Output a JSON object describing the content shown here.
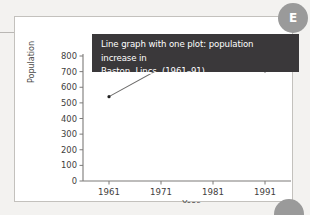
{
  "figure": {
    "badge_label": "E",
    "caption": "Line graph with one plot: population increase in\nBaston, Lincs. (1961–91)"
  },
  "chart_data": {
    "type": "line",
    "title": "Line graph with one plot: population increase in Baston, Lincs. (1961–91)",
    "xlabel": "Year",
    "ylabel": "Population",
    "categories": [
      "1961",
      "1971",
      "1981",
      "1991"
    ],
    "x": [
      1961,
      1971,
      1981,
      1991
    ],
    "values": [
      540,
      723,
      725,
      705
    ],
    "series": [
      {
        "name": "Baston, Lincs. population",
        "values": [
          540,
          723,
          725,
          705
        ]
      }
    ],
    "xlim": [
      1956,
      1996
    ],
    "ylim": [
      0,
      800
    ],
    "ytick_labels": [
      "0",
      "100",
      "200",
      "300",
      "400",
      "500",
      "600",
      "700",
      "800"
    ],
    "ytick_values": [
      0,
      100,
      200,
      300,
      400,
      500,
      600,
      700,
      800
    ],
    "xtick_labels": [
      "1961",
      "1971",
      "1981",
      "1991"
    ],
    "grid": false,
    "legend": false,
    "marker": "dot",
    "line_color": "#6d6c6b",
    "marker_color": "#222222",
    "axis_color": "#7c7a78"
  }
}
